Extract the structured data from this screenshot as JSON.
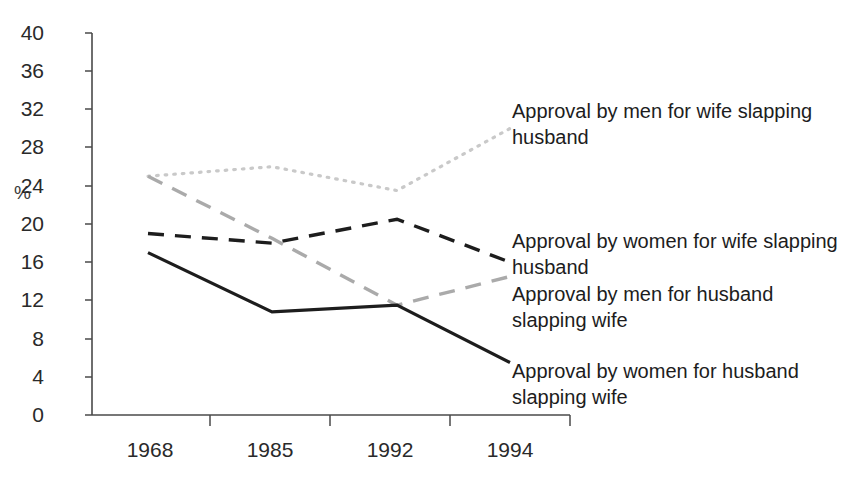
{
  "chart_data": {
    "type": "line",
    "title": "",
    "xlabel": "",
    "ylabel": "%",
    "categories": [
      "1968",
      "1985",
      "1992",
      "1994"
    ],
    "ylim": [
      0,
      40
    ],
    "yticks": [
      "0",
      "4",
      "8",
      "12",
      "16",
      "20",
      "24",
      "28",
      "32",
      "36",
      "40"
    ],
    "grid": false,
    "legend_position": "right-inline",
    "series": [
      {
        "name": "Approval  by men for wife slapping\nhusband",
        "style": "dotted",
        "color": "#c9c9c9",
        "values": [
          25,
          26,
          23.5,
          30
        ]
      },
      {
        "name": "Approval  by women for wife slapping\nhusband",
        "style": "dashed",
        "color": "#1d1d1d",
        "values": [
          19,
          18,
          20.5,
          16
        ]
      },
      {
        "name": "Approval  by men for husband\nslapping wife",
        "style": "dashed",
        "color": "#aaaaaa",
        "values": [
          25,
          18.5,
          11.5,
          14.5
        ]
      },
      {
        "name": "Approval  by women for husband\nslapping wife",
        "style": "solid",
        "color": "#1d1d1d",
        "values": [
          17,
          10.8,
          11.5,
          5.5
        ]
      }
    ]
  },
  "axes": {
    "y_axis_label": "%",
    "y_ticks": [
      "40",
      "36",
      "32",
      "28",
      "24",
      "20",
      "16",
      "12",
      "8",
      "4",
      "0"
    ],
    "x_ticks": [
      "1968",
      "1985",
      "1992",
      "1994"
    ]
  },
  "legend": {
    "items": [
      {
        "label": "Approval  by men for wife slapping\nhusband"
      },
      {
        "label": "Approval  by women for wife slapping\nhusband"
      },
      {
        "label": "Approval  by men for husband\nslapping wife"
      },
      {
        "label": "Approval  by women for husband\nslapping wife"
      }
    ]
  },
  "colors": {
    "axis": "#4a4a4a",
    "solid_dark": "#1d1d1d",
    "dashed_dark": "#1d1d1d",
    "dashed_gray": "#aaaaaa",
    "dotted_gray": "#c9c9c9"
  }
}
